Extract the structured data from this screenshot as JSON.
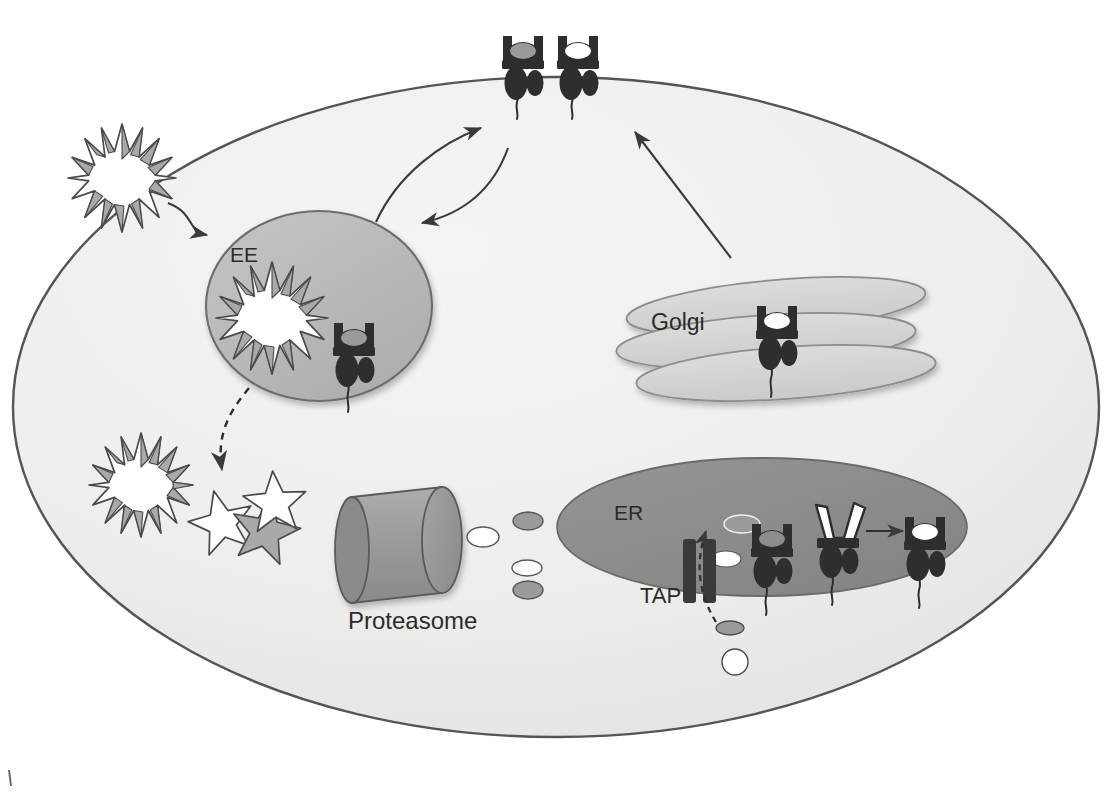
{
  "figure": {
    "type": "cell-biology-schematic",
    "canvas": {
      "width": 1111,
      "height": 792
    },
    "background_color": "#ffffff"
  },
  "labels": {
    "early_endosome": "EE",
    "golgi": "Golgi",
    "endoplasmic_reticulum": "ER",
    "tap_transporter": "TAP",
    "proteasome": "Proteasome"
  },
  "colors": {
    "cell_fill": "#eeeeec",
    "cell_stroke": "#555555",
    "endosome_fill": "#b9b9b7",
    "endosome_stroke": "#6d6d6d",
    "golgi_fill": "#d2d2d0",
    "golgi_stroke": "#8d8d8b",
    "er_fill": "#8d8d8b",
    "er_stroke": "#6a6a68",
    "proteasome_fill": "#9a9a98",
    "proteasome_stroke": "#5a5a58",
    "mhc_dark": "#2e2e2e",
    "peptide_gray": "#9a9a98",
    "peptide_white": "#ffffff",
    "antigen_fill": "#ffffff",
    "antigen_shade": "#a9a9a7",
    "antigen_stroke": "#4a4a4a",
    "arrow_stroke": "#3a3a3a",
    "tap_fill": "#3a3a3a"
  },
  "structures": [
    {
      "name": "plasma-membrane-cell-body",
      "kind": "ellipse",
      "label": "",
      "cx": 556,
      "cy": 407,
      "rx": 543,
      "ry": 330
    },
    {
      "name": "early-endosome",
      "kind": "ellipse",
      "label": "EE",
      "cx": 319,
      "cy": 306,
      "rx": 113,
      "ry": 95
    },
    {
      "name": "golgi-apparatus",
      "kind": "stacked-cisternae",
      "label": "Golgi",
      "cisternae": 3
    },
    {
      "name": "endoplasmic-reticulum",
      "kind": "ellipse",
      "label": "ER",
      "cx": 762,
      "cy": 527,
      "rx": 205,
      "ry": 69
    },
    {
      "name": "proteasome",
      "kind": "cylinder",
      "label": "Proteasome"
    },
    {
      "name": "tap-transporter",
      "kind": "membrane-channel",
      "label": "TAP",
      "bars": 2
    }
  ],
  "mhc_molecules": [
    {
      "name": "mhc-surface-left",
      "location": "plasma membrane",
      "peptide": "gray",
      "groove": "closed",
      "x": 523,
      "y": 52
    },
    {
      "name": "mhc-surface-right",
      "location": "plasma membrane",
      "peptide": "white",
      "groove": "closed",
      "x": 578,
      "y": 52
    },
    {
      "name": "mhc-endosome",
      "location": "early endosome",
      "peptide": "gray",
      "groove": "closed",
      "x": 354,
      "y": 339
    },
    {
      "name": "mhc-golgi",
      "location": "Golgi",
      "peptide": "white",
      "groove": "closed",
      "x": 777,
      "y": 322
    },
    {
      "name": "mhc-er-empty",
      "location": "ER",
      "peptide": "none",
      "groove": "closed",
      "x": 772,
      "y": 540
    },
    {
      "name": "mhc-er-open",
      "location": "ER",
      "peptide": "none",
      "groove": "open",
      "x": 838,
      "y": 530
    },
    {
      "name": "mhc-er-loaded",
      "location": "ER",
      "peptide": "white",
      "groove": "closed",
      "x": 925,
      "y": 533
    }
  ],
  "antigens": [
    {
      "name": "antigen-extracellular",
      "kind": "spiky-star",
      "points": 16,
      "state": "intact",
      "cx": 122,
      "cy": 178,
      "r": 54
    },
    {
      "name": "antigen-in-endosome",
      "kind": "spiky-star",
      "points": 16,
      "state": "intact",
      "cx": 272,
      "cy": 318,
      "r": 56
    },
    {
      "name": "antigen-degraded-1",
      "kind": "spiky-star",
      "points": 16,
      "state": "degrading",
      "cx": 141,
      "cy": 485,
      "r": 52
    },
    {
      "name": "antigen-fragment-1",
      "kind": "star-5",
      "points": 5,
      "state": "fragment",
      "cx": 222,
      "cy": 524,
      "r": 34
    },
    {
      "name": "antigen-fragment-2",
      "kind": "star-5",
      "points": 5,
      "state": "fragment",
      "cx": 262,
      "cy": 528,
      "r": 36
    },
    {
      "name": "antigen-fragment-3",
      "kind": "star-5",
      "points": 5,
      "state": "fragment",
      "cx": 272,
      "cy": 506,
      "r": 33
    }
  ],
  "peptides": [
    {
      "name": "peptide-proteasome-exit",
      "fill": "white",
      "cx": 483,
      "cy": 537,
      "rx": 16,
      "ry": 10
    },
    {
      "name": "peptide-cytosol-1",
      "fill": "gray",
      "cx": 528,
      "cy": 521,
      "rx": 15,
      "ry": 9
    },
    {
      "name": "peptide-cytosol-2",
      "fill": "white",
      "cx": 527,
      "cy": 568,
      "rx": 15,
      "ry": 8
    },
    {
      "name": "peptide-cytosol-3",
      "fill": "gray",
      "cx": 528,
      "cy": 590,
      "rx": 15,
      "ry": 9
    },
    {
      "name": "peptide-tap-entry",
      "fill": "gray",
      "cx": 730,
      "cy": 628,
      "rx": 14,
      "ry": 7
    },
    {
      "name": "peptide-below-cell",
      "fill": "white",
      "cx": 735,
      "cy": 662,
      "rx": 13,
      "ry": 13
    },
    {
      "name": "peptide-er-lumen-1",
      "fill": "gray",
      "cx": 742,
      "cy": 524,
      "rx": 18,
      "ry": 9
    },
    {
      "name": "peptide-er-lumen-2",
      "fill": "white",
      "cx": 726,
      "cy": 559,
      "rx": 15,
      "ry": 8
    }
  ],
  "arrows": [
    {
      "name": "arrow-antigen-uptake",
      "style": "solid",
      "from": "extracellular antigen",
      "to": "early endosome"
    },
    {
      "name": "arrow-endosome-to-surface",
      "style": "solid",
      "from": "early endosome",
      "to": "plasma membrane"
    },
    {
      "name": "arrow-surface-to-endosome",
      "style": "solid",
      "from": "plasma membrane",
      "to": "early endosome"
    },
    {
      "name": "arrow-golgi-to-surface",
      "style": "solid",
      "from": "Golgi",
      "to": "plasma membrane"
    },
    {
      "name": "arrow-endosome-degradation",
      "style": "dashed",
      "from": "early endosome",
      "to": "degraded antigen"
    },
    {
      "name": "arrow-tap-transport",
      "style": "dashed",
      "from": "cytosolic peptide",
      "to": "ER lumen"
    },
    {
      "name": "arrow-mhc-loading",
      "style": "solid",
      "from": "open MHC",
      "to": "loaded MHC"
    }
  ]
}
